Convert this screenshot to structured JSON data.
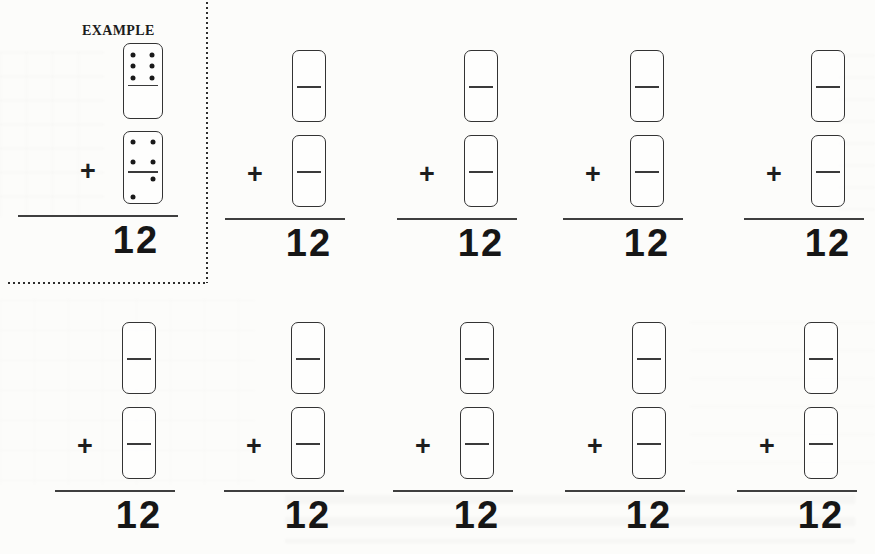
{
  "worksheet": {
    "colors": {
      "ink": "#2b2b2b",
      "paper": "#fcfcfa"
    },
    "example": {
      "label": "EXAMPLE",
      "operator": "+",
      "answer": "12",
      "dominoes": [
        {
          "top_pips": 6,
          "bottom_pips": 0
        },
        {
          "top_pips": 4,
          "bottom_pips": 2
        }
      ]
    },
    "problems": [
      {
        "operator": "+",
        "answer": "12"
      },
      {
        "operator": "+",
        "answer": "12"
      },
      {
        "operator": "+",
        "answer": "12"
      },
      {
        "operator": "+",
        "answer": "12"
      },
      {
        "operator": "+",
        "answer": "12"
      },
      {
        "operator": "+",
        "answer": "12"
      },
      {
        "operator": "+",
        "answer": "12"
      },
      {
        "operator": "+",
        "answer": "12"
      },
      {
        "operator": "+",
        "answer": "12"
      }
    ]
  }
}
